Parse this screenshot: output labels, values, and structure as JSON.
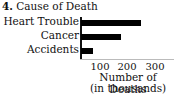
{
  "chart_data": {
    "type": "bar",
    "orientation": "horizontal",
    "number": "4.",
    "title": "Cause of Death",
    "categories": [
      "Heart Trouble",
      "Cancer",
      "Accidents"
    ],
    "values": [
      250,
      175,
      75
    ],
    "xlabel": "Number of Deaths",
    "xlabel_sub": "(in thousands)",
    "ylabel": "",
    "xticks": [
      "100",
      "200",
      "300"
    ],
    "xlim": [
      0,
      330
    ],
    "grid": false,
    "legend": null,
    "bar_color": "#000000"
  }
}
